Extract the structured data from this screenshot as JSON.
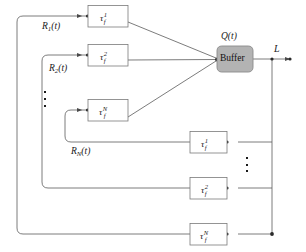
{
  "diagram": {
    "colors": {
      "line": "#5a5a5a",
      "box_stroke": "#7a7a7a",
      "buffer_fill": "#b3b3b3",
      "buffer_stroke": "#8a8a8a",
      "text": "#1a1a1a"
    },
    "buffer": {
      "label": "Buffer",
      "state_label": "Q(t)"
    },
    "output": {
      "label": "L"
    },
    "arrival_streams": [
      {
        "flow_label_main": "R",
        "flow_label_sub": "1",
        "flow_label_arg": "(t)",
        "tau": "τ",
        "superscript": "1",
        "subscript": "f"
      },
      {
        "flow_label_main": "R",
        "flow_label_sub": "2",
        "flow_label_arg": "(t)",
        "tau": "τ",
        "superscript": "2",
        "subscript": "f"
      },
      {
        "flow_label_main": "R",
        "flow_label_sub": "N",
        "flow_label_arg": "(t)",
        "tau": "τ",
        "superscript": "N",
        "subscript": "f"
      }
    ],
    "feedback_delays": [
      {
        "tau": "τ",
        "superscript": "1",
        "subscript": "f"
      },
      {
        "tau": "τ",
        "superscript": "2",
        "subscript": "f"
      },
      {
        "tau": "τ",
        "superscript": "N",
        "subscript": "f"
      }
    ],
    "ellipsis": {
      "left": "vertical-ellipsis",
      "right": "vertical-ellipsis"
    }
  }
}
